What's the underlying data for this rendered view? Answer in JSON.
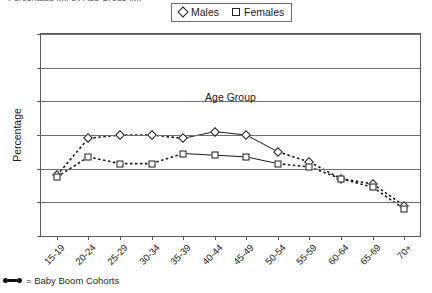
{
  "title_clipped": "Percentage ..... by Age Group .....",
  "legend": {
    "position": "top-center",
    "entries": [
      {
        "label": "Males",
        "marker": "diamond-outline-icon"
      },
      {
        "label": "Females",
        "marker": "square-outline-icon"
      }
    ]
  },
  "footnote": {
    "marker": "baby-boom-line-icon",
    "text": "= Baby Boom Cohorts"
  },
  "axes": {
    "y_label": "Percentage",
    "y_ticks": [
      "0",
      "10",
      "20",
      "30",
      "40",
      "50",
      "60"
    ],
    "x_label": "Age Group"
  },
  "chart_data": {
    "type": "line",
    "title": "",
    "xlabel": "Age Group",
    "ylabel": "Percentage",
    "ylim": [
      0,
      60
    ],
    "ytick_step": 10,
    "grid": "horizontal",
    "legend_position": "top-center",
    "categories": [
      "15-19",
      "20-24",
      "25-29",
      "30-34",
      "35-39",
      "40-44",
      "45-49",
      "50-54",
      "55-59",
      "60-64",
      "65-69",
      "70+"
    ],
    "series": [
      {
        "name": "Males",
        "marker": "diamond",
        "values": [
          18,
          29,
          30,
          30,
          29,
          31,
          30,
          25,
          22,
          17,
          15.5,
          9
        ]
      },
      {
        "name": "Females",
        "marker": "square",
        "values": [
          17.5,
          23.5,
          21.5,
          21.5,
          24.5,
          24,
          23.5,
          21.5,
          20.5,
          17,
          14.5,
          8
        ]
      }
    ],
    "annotations": [
      {
        "type": "line-style-emphasis",
        "text": "Baby Boom Cohorts",
        "style": "solid",
        "from_category": "35-39",
        "to_category": "50-54",
        "note": "solid segments mark baby boom cohorts; all other segments dashed"
      }
    ]
  }
}
